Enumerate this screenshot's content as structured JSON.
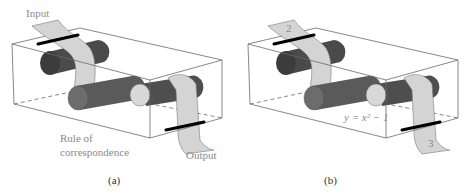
{
  "figure": {
    "panel_a": {
      "caption": "(a)",
      "input_label": "Input",
      "rule_label_line1": "Rule of",
      "rule_label_line2": "correspondence",
      "output_label": "Output"
    },
    "panel_b": {
      "caption": "(b)",
      "input_value": "2",
      "rule_label": "y = x² − 1",
      "output_value": "3"
    }
  },
  "colors": {
    "box_line": "#6a6a6a",
    "cylinder_dark": "#4a4a4a",
    "cylinder_mid": "#6c6c6c",
    "cylinder_end_light": "#d8d8d8",
    "tape": "#d4d4d4",
    "tape_edge": "#7a7a7a",
    "clamp": "#000000",
    "label_text": "#8a8a8a"
  }
}
